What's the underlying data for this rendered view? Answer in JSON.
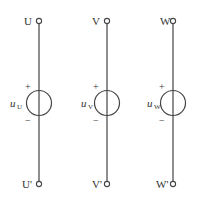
{
  "phases": [
    {
      "top": "U",
      "bottom": "U'",
      "source": "u",
      "sub": "U",
      "plus": "+",
      "minus": "−"
    },
    {
      "top": "V",
      "bottom": "V'",
      "source": "u",
      "sub": "V",
      "plus": "+",
      "minus": "−"
    },
    {
      "top": "W",
      "bottom": "W'",
      "source": "u",
      "sub": "W",
      "plus": "+",
      "minus": "−"
    }
  ],
  "colors": {
    "line": "#444444",
    "text": "#333333"
  }
}
